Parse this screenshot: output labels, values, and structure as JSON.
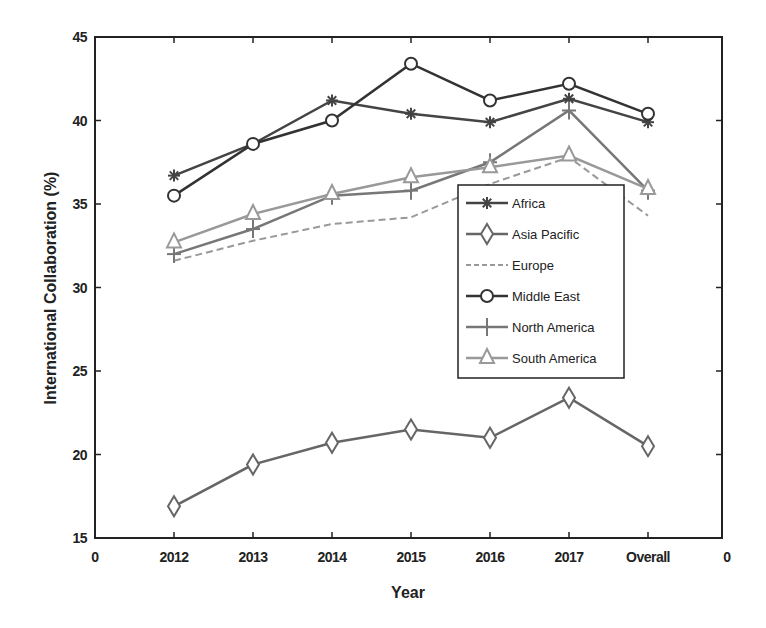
{
  "chart_data": {
    "type": "line",
    "title": "",
    "xlabel": "Year",
    "ylabel": "International Collaboration (%)",
    "categories": [
      "2012",
      "2013",
      "2014",
      "2015",
      "2016",
      "2017",
      "Overall"
    ],
    "x_tick_labels": [
      "0",
      "2012",
      "2013",
      "2014",
      "2015",
      "2016",
      "2017",
      "Overall",
      "0"
    ],
    "y_ticks": [
      15,
      20,
      25,
      30,
      35,
      40,
      45
    ],
    "ylim": [
      15,
      45
    ],
    "grid": false,
    "legend_position": "inside right-center",
    "series": [
      {
        "name": "Africa",
        "marker": "asterisk",
        "style": "solid",
        "color": "#444444",
        "values": [
          36.7,
          38.6,
          41.2,
          40.4,
          39.9,
          41.3,
          39.9
        ]
      },
      {
        "name": "Asia Pacific",
        "marker": "diamond",
        "style": "solid",
        "color": "#666666",
        "values": [
          16.9,
          19.4,
          20.7,
          21.5,
          21.0,
          23.4,
          20.5
        ]
      },
      {
        "name": "Europe",
        "marker": "none",
        "style": "dashed",
        "color": "#999999",
        "values": [
          31.6,
          32.8,
          33.8,
          34.2,
          36.2,
          37.8,
          34.3
        ]
      },
      {
        "name": "Middle East",
        "marker": "circle",
        "style": "solid",
        "color": "#333333",
        "values": [
          35.5,
          38.6,
          40.0,
          43.4,
          41.2,
          42.2,
          40.4
        ]
      },
      {
        "name": "North America",
        "marker": "plus",
        "style": "solid",
        "color": "#777777",
        "values": [
          32.0,
          33.5,
          35.5,
          35.8,
          37.5,
          40.6,
          35.8
        ]
      },
      {
        "name": "South America",
        "marker": "triangle",
        "style": "solid",
        "color": "#999999",
        "values": [
          32.7,
          34.4,
          35.6,
          36.6,
          37.2,
          37.9,
          35.9
        ]
      }
    ]
  }
}
